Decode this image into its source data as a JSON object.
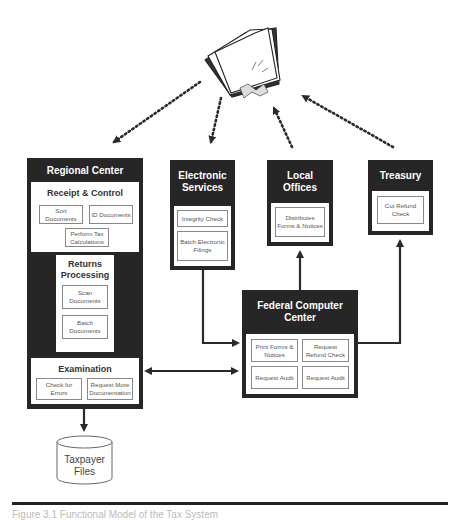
{
  "diagram": {
    "top_icon": "tax-papers-bundle-icon",
    "regional_center": {
      "title": "Regional Center",
      "receipt_control": {
        "title": "Receipt & Control",
        "items": [
          "Sort Documents",
          "ID Documents",
          "Perform Tax Calculations"
        ]
      },
      "returns_processing": {
        "title_line1": "Returns",
        "title_line2": "Processing",
        "items": [
          "Scan Documents",
          "Batch Documents"
        ]
      },
      "examination": {
        "title": "Examination",
        "items": [
          "Check for Errors",
          "Request More Documentation"
        ]
      }
    },
    "electronic_services": {
      "title_line1": "Electronic",
      "title_line2": "Services",
      "items": [
        "Integrity Check",
        "Batch Electronic Filings"
      ]
    },
    "local_offices": {
      "title_line1": "Local",
      "title_line2": "Offices",
      "items": [
        "Distributes Forms & Notices"
      ]
    },
    "treasury": {
      "title": "Treasury",
      "items": [
        "Cut Refund Check"
      ]
    },
    "federal_computer_center": {
      "title_line1": "Federal Computer",
      "title_line2": "Center",
      "items": [
        "Print Forms & Notices",
        "Request Refund Check",
        "Request Audit",
        "Request Audit"
      ]
    },
    "taxpayer_files": {
      "line1": "Taxpayer",
      "line2": "Files"
    },
    "caption": "Figure 3.1 Functional Model of the Tax System"
  }
}
